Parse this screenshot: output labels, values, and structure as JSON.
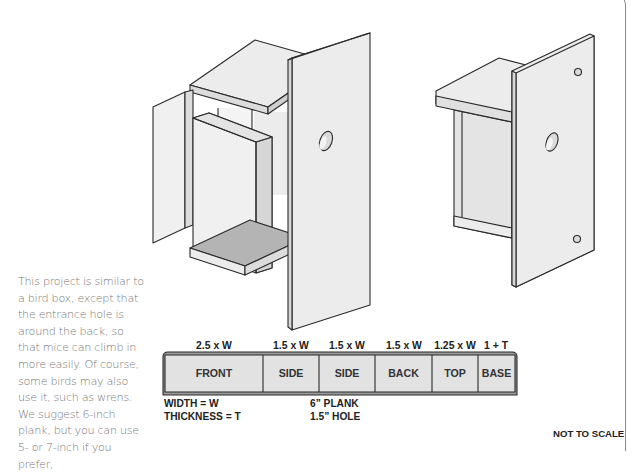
{
  "description": "This project is similar to a bird box, except that the entrance hole is around the back, so that mice can climb in more easily. Of course, some birds may also use it, such as wrens. We suggest 6-inch plank, but you can use 5- or 7-inch if you prefer,",
  "cut_plan": {
    "pieces": [
      {
        "label": "FRONT",
        "size": "2.5 x W"
      },
      {
        "label": "SIDE",
        "size": "1.5 x W"
      },
      {
        "label": "SIDE",
        "size": "1.5 x W"
      },
      {
        "label": "BACK",
        "size": "1.5 x W"
      },
      {
        "label": "TOP",
        "size": "1.25 x W"
      },
      {
        "label": "BASE",
        "size": "1 + T"
      }
    ]
  },
  "legend": {
    "width": "WIDTH = W",
    "thickness": "THICKNESS = T",
    "plank": "6” PLANK",
    "hole": "1.5” HOLE"
  },
  "scale_note": "NOT TO SCALE",
  "colors": {
    "panel": "#ececec",
    "panel_side": "#d9d9d9",
    "panel_dark": "#b4b4b4",
    "outline": "#2a2a2a",
    "text": "#777777"
  }
}
